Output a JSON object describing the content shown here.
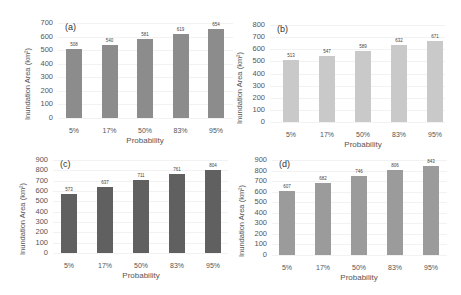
{
  "chart_data": [
    {
      "type": "bar",
      "panel": "(a)",
      "categories": [
        "5%",
        "17%",
        "50%",
        "83%",
        "95%"
      ],
      "values": [
        508,
        540,
        581,
        619,
        654
      ],
      "xlabel": "Probability",
      "ylabel": "Inundation Area (km²)",
      "ylim": [
        0,
        700
      ],
      "yticks": [
        "0",
        "100",
        "200",
        "300",
        "400",
        "500",
        "600",
        "700"
      ],
      "color": "#8c8c8c"
    },
    {
      "type": "bar",
      "panel": "(b)",
      "categories": [
        "5%",
        "17%",
        "50%",
        "83%",
        "95%"
      ],
      "values": [
        513,
        547,
        589,
        632,
        671
      ],
      "xlabel": "Probability",
      "ylabel": "Inundation Area (km²)",
      "ylim": [
        0,
        800
      ],
      "yticks": [
        "0",
        "100",
        "200",
        "300",
        "400",
        "500",
        "600",
        "700",
        "800"
      ],
      "color": "#c9c9c9"
    },
    {
      "type": "bar",
      "panel": "(c)",
      "categories": [
        "5%",
        "17%",
        "50%",
        "83%",
        "95%"
      ],
      "values": [
        573,
        637,
        711,
        761,
        804
      ],
      "xlabel": "Probability",
      "ylabel": "Inundation Area (km²)",
      "ylim": [
        0,
        900
      ],
      "yticks": [
        "0",
        "100",
        "200",
        "300",
        "400",
        "500",
        "600",
        "700",
        "800",
        "900"
      ],
      "color": "#606060"
    },
    {
      "type": "bar",
      "panel": "(d)",
      "categories": [
        "5%",
        "17%",
        "50%",
        "83%",
        "95%"
      ],
      "values": [
        607,
        682,
        746,
        806,
        843
      ],
      "xlabel": "Probability",
      "ylabel": "Inundation Area (km²)",
      "ylim": [
        0,
        900
      ],
      "yticks": [
        "0",
        "100",
        "200",
        "300",
        "400",
        "500",
        "600",
        "700",
        "800",
        "900"
      ],
      "color": "#9b9b9b"
    }
  ]
}
